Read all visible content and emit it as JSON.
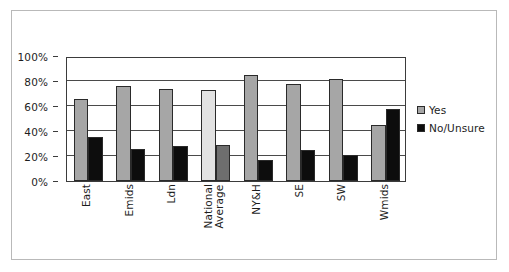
{
  "chart_data": {
    "type": "bar",
    "title": "",
    "subtitle": "",
    "xlabel": "",
    "ylabel": "",
    "categories": [
      "East",
      "Emids",
      "Ldn",
      "National Average",
      "NY&H",
      "SE",
      "SW",
      "Wmids"
    ],
    "series": [
      {
        "name": "Yes",
        "values": [
          66,
          76,
          74,
          73,
          85,
          77.5,
          82,
          45
        ]
      },
      {
        "name": "No/Unsure",
        "values": [
          35,
          26,
          28,
          28.5,
          17,
          24.5,
          21,
          57.5
        ]
      }
    ],
    "ylim": [
      0,
      100
    ],
    "ytick_values": [
      0,
      20,
      40,
      60,
      80,
      100
    ],
    "ytick_labels": [
      "0%",
      "20%",
      "40%",
      "60%",
      "80%",
      "100%"
    ],
    "grid": true,
    "legend_position": "right",
    "value_format": "percent",
    "highlight_category": "National Average",
    "colors": {
      "yes": "#a6a6a6",
      "no": "#0d0d0d",
      "yes_highlight": "#e2e2e2",
      "no_highlight": "#6e6e6e",
      "bar_outline": "#2a2a2a",
      "axis": "#3b3b3b",
      "gridline": "#4a4a4a",
      "text": "#1d1d1d",
      "frame": "#b9b9b9",
      "background": "#ffffff"
    }
  },
  "legend": {
    "items": [
      {
        "label": "Yes",
        "color": "#a6a6a6"
      },
      {
        "label": "No/Unsure",
        "color": "#0d0d0d"
      }
    ]
  }
}
